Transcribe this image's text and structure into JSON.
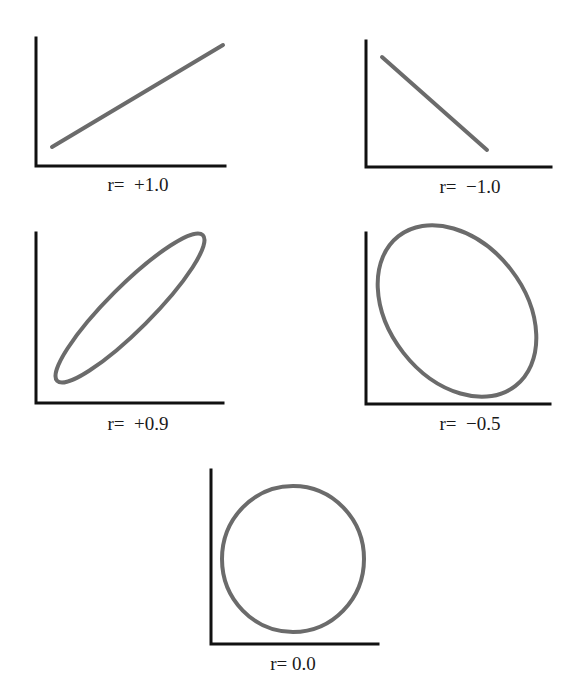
{
  "colors": {
    "axis": "#111111",
    "curve": "#6b6b6b",
    "background": "#ffffff"
  },
  "panels": [
    {
      "id": "r-plus-1",
      "label": "r=  +1.0",
      "shape": "line",
      "r": 1.0
    },
    {
      "id": "r-minus-1",
      "label": "r=  −1.0",
      "shape": "line",
      "r": -1.0
    },
    {
      "id": "r-plus-0.9",
      "label": "r=  +0.9",
      "shape": "ellipse",
      "r": 0.9
    },
    {
      "id": "r-minus-0.5",
      "label": "r=  −0.5",
      "shape": "ellipse",
      "r": -0.5
    },
    {
      "id": "r-zero",
      "label": "r= 0.0",
      "shape": "circle",
      "r": 0.0
    }
  ]
}
